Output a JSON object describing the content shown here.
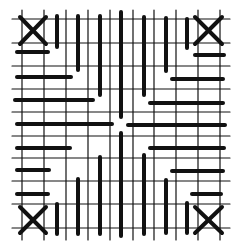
{
  "diagram": {
    "colors": {
      "background": "#ffffff",
      "ink": "#111111"
    },
    "grid": {
      "vertical_lines_x": [
        22,
        44,
        66,
        88,
        110,
        133,
        154,
        176,
        198,
        220
      ],
      "horizontal_lines_y": [
        19,
        43,
        66,
        89,
        112,
        136,
        158,
        181,
        204,
        228
      ],
      "x_extent": [
        12,
        230
      ],
      "y_extent": [
        10,
        240
      ]
    },
    "crosses": [
      {
        "name": "cross-top-left",
        "x1": 20,
        "y1": 17,
        "x2": 46,
        "y2": 44
      },
      {
        "name": "cross-top-right",
        "x1": 195,
        "y1": 17,
        "x2": 222,
        "y2": 44
      },
      {
        "name": "cross-bottom-left",
        "x1": 20,
        "y1": 207,
        "x2": 46,
        "y2": 233
      },
      {
        "name": "cross-bottom-right",
        "x1": 195,
        "y1": 207,
        "x2": 222,
        "y2": 233
      }
    ],
    "vertical_bars": [
      {
        "x": 57,
        "y1": 16,
        "y2": 47
      },
      {
        "x": 78,
        "y1": 16,
        "y2": 70
      },
      {
        "x": 100,
        "y1": 16,
        "y2": 95
      },
      {
        "x": 121,
        "y1": 12,
        "y2": 117
      },
      {
        "x": 144,
        "y1": 17,
        "y2": 95
      },
      {
        "x": 166,
        "y1": 18,
        "y2": 71
      },
      {
        "x": 187,
        "y1": 19,
        "y2": 48
      },
      {
        "x": 57,
        "y1": 204,
        "y2": 234
      },
      {
        "x": 78,
        "y1": 179,
        "y2": 234
      },
      {
        "x": 100,
        "y1": 157,
        "y2": 234
      },
      {
        "x": 121,
        "y1": 133,
        "y2": 236
      },
      {
        "x": 144,
        "y1": 155,
        "y2": 234
      },
      {
        "x": 166,
        "y1": 180,
        "y2": 233
      },
      {
        "x": 187,
        "y1": 203,
        "y2": 233
      }
    ],
    "horizontal_bars": [
      {
        "y": 52,
        "x1": 17,
        "x2": 48
      },
      {
        "y": 77,
        "x1": 17,
        "x2": 71
      },
      {
        "y": 100,
        "x1": 15,
        "x2": 93
      },
      {
        "y": 124,
        "x1": 17,
        "x2": 112
      },
      {
        "y": 148,
        "x1": 17,
        "x2": 70
      },
      {
        "y": 170,
        "x1": 17,
        "x2": 49
      },
      {
        "y": 194,
        "x1": 17,
        "x2": 48
      },
      {
        "y": 55,
        "x1": 195,
        "x2": 224
      },
      {
        "y": 79,
        "x1": 172,
        "x2": 223
      },
      {
        "y": 103,
        "x1": 150,
        "x2": 223
      },
      {
        "y": 125,
        "x1": 128,
        "x2": 225
      },
      {
        "y": 148,
        "x1": 150,
        "x2": 224
      },
      {
        "y": 171,
        "x1": 172,
        "x2": 223
      },
      {
        "y": 194,
        "x1": 192,
        "x2": 221
      },
      {
        "y": 147,
        "x1": 35,
        "x2": 35
      }
    ]
  }
}
